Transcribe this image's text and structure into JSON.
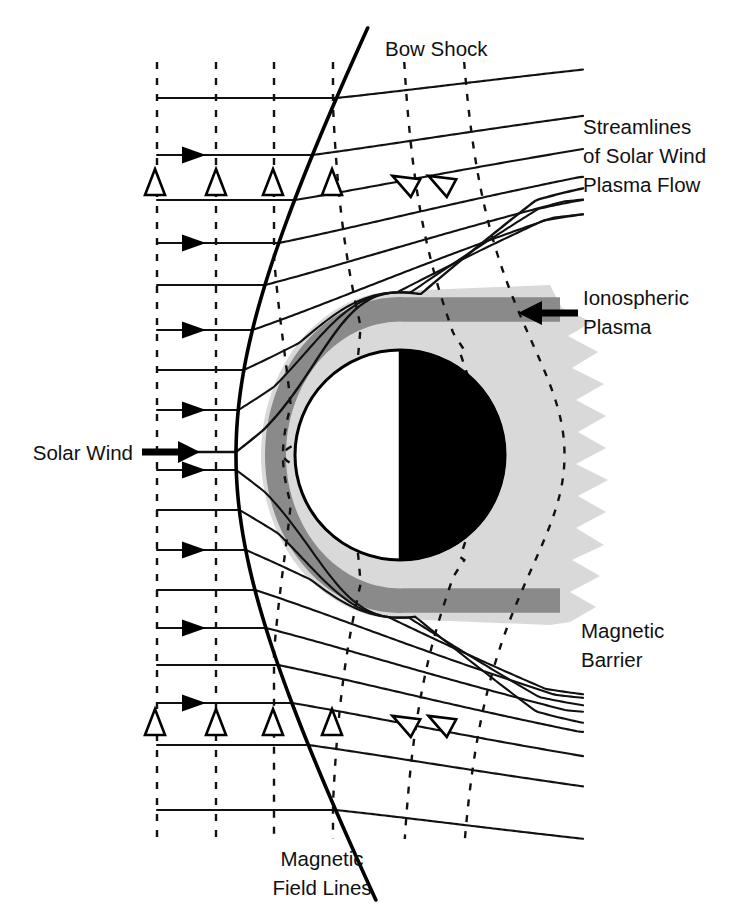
{
  "figure": {
    "title_visible": false,
    "background_color": "#ffffff",
    "width": 734,
    "height": 924
  },
  "colors": {
    "line": "#111111",
    "bow_shock": "#000000",
    "magnetic_barrier": "#8a8a8a",
    "ionospheric_plasma": "#d9d9d9",
    "planet_day_side": "#ffffff",
    "planet_night_side": "#000000",
    "dashed_field_line": "#111111",
    "label_text": "#111111"
  },
  "labels": [
    {
      "id": "bow-shock",
      "text": "Bow Shock",
      "x": 385,
      "y": 56,
      "anchor": "start",
      "lines": [
        "Bow Shock"
      ]
    },
    {
      "id": "streamlines",
      "text": "Streamlines of Solar Wind Plasma Flow",
      "x": 583,
      "y": 134,
      "anchor": "start",
      "lines": [
        "Streamlines",
        "of Solar Wind",
        "Plasma Flow"
      ]
    },
    {
      "id": "ionospheric",
      "text": "Ionospheric Plasma",
      "x": 583,
      "y": 305,
      "anchor": "start",
      "lines": [
        "Ionospheric",
        "Plasma"
      ]
    },
    {
      "id": "solar-wind",
      "text": "Solar Wind",
      "x": 133,
      "y": 460,
      "anchor": "end",
      "lines": [
        "Solar Wind"
      ]
    },
    {
      "id": "magnetic-barrier",
      "text": "Magnetic Barrier",
      "x": 581,
      "y": 638,
      "anchor": "start",
      "lines": [
        "Magnetic",
        "Barrier"
      ]
    },
    {
      "id": "magnetic-field-lines",
      "text": "Magnetic Field Lines",
      "x": 322,
      "y": 866,
      "anchor": "middle",
      "lines": [
        "Magnetic",
        "Field Lines"
      ]
    }
  ],
  "label_line_height": 29,
  "annotation_arrows": [
    {
      "id": "solar-wind-arrow",
      "direction": "right",
      "x1": 142,
      "y": 452,
      "x2": 200,
      "shaft": 7,
      "head_w": 22,
      "head_h": 22
    },
    {
      "id": "ionospheric-arrow",
      "direction": "left",
      "x1": 578,
      "y": 313,
      "x2": 518,
      "shaft": 7,
      "head_w": 24,
      "head_h": 24
    }
  ],
  "geometry": {
    "planet": {
      "cx": 400,
      "cy": 455,
      "r": 105,
      "terminator_x": 400
    },
    "bow_shock": {
      "nose_x": 236,
      "nose_y": 455,
      "comment": "hyperbola-like open curve"
    },
    "magnetic_barrier_band": {
      "inner_offset": 7,
      "outer_offset": 27
    },
    "field_line_x_positions": [
      157,
      216,
      274,
      333,
      400,
      455
    ],
    "field_line_dash": "7,9",
    "field_line_top": 62,
    "field_line_bottom": 840
  },
  "chart_data": {
    "type": "diagram",
    "elements": [
      {
        "name": "Bow Shock",
        "kind": "curve",
        "style": "solid thick black",
        "description": "Open hyperbolic shock surface upstream of the planet, nose at the sub-solar point"
      },
      {
        "name": "Streamlines of Solar Wind Plasma Flow",
        "kind": "curves",
        "style": "solid thin black",
        "count": 18,
        "description": "Horizontal upstream of the shock, deflected around the obstacle downstream"
      },
      {
        "name": "Magnetic Field Lines",
        "kind": "curves",
        "style": "dashed black",
        "count": 6,
        "description": "Vertical upstream, draped around the ionosphere inside the magnetosheath"
      },
      {
        "name": "Magnetic Barrier",
        "kind": "region",
        "style": "dark grey band",
        "color": "#8a8a8a",
        "description": "Annular layer of piled-up magnetic flux hugging the ionopause"
      },
      {
        "name": "Ionospheric Plasma",
        "kind": "region",
        "style": "light grey with ragged tailward edge",
        "color": "#d9d9d9",
        "description": "Planetary ionosphere extending into an irregular tail"
      },
      {
        "name": "Planet",
        "kind": "disk",
        "style": "half white (dayside) half black (nightside)",
        "description": "Terminator drawn as a vertical line through the disk centre"
      },
      {
        "name": "Solar Wind",
        "kind": "arrow",
        "direction": "left to right",
        "description": "Incoming flow direction indicator"
      }
    ],
    "flow_direction": "left to right",
    "marker_triangles": {
      "count_per_row": 6,
      "rows_y": [
        182,
        722
      ],
      "upstream_x": [
        155,
        216,
        273,
        332
      ],
      "rotated_x": [
        404,
        440
      ],
      "style": "hollow outlined triangles marking magnetic field vector heads"
    }
  }
}
